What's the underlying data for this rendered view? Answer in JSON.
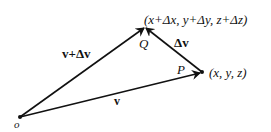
{
  "diagram": {
    "type": "vector-triangle",
    "points": {
      "origin": {
        "label": "o",
        "x": 20,
        "y": 117
      },
      "P": {
        "label": "P",
        "coords": "(x, y, z)",
        "x": 202,
        "y": 72
      },
      "Q": {
        "label": "Q",
        "coords": "(x+Δx, y+Δy, z+Δz)",
        "x": 145,
        "y": 27
      }
    },
    "vectors": [
      {
        "label": "v",
        "from": "origin",
        "to": "P"
      },
      {
        "label": "v+Δv",
        "from": "origin",
        "to": "Q"
      },
      {
        "label": "Δv",
        "from": "P",
        "to": "Q"
      }
    ]
  },
  "labels": {
    "origin": "o",
    "P": "P",
    "Q": "Q",
    "P_coords": "(x, y, z)",
    "Q_coords": "(x+Δx, y+Δy, z+Δz)",
    "v": "v",
    "v_plus_dv": "v+Δv",
    "dv": "Δv"
  },
  "colors": {
    "line": "#111111",
    "background": "#ffffff"
  }
}
